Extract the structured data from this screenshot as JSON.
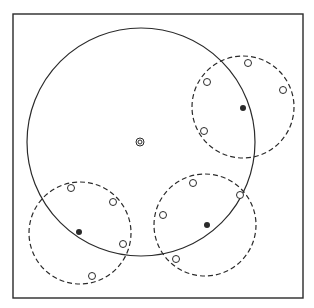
{
  "canvas": {
    "width": 314,
    "height": 308,
    "background": "#ffffff",
    "ink": "#2a2a2a"
  },
  "frame": {
    "x": 13,
    "y": 14,
    "width": 290,
    "height": 284
  },
  "main_circle": {
    "cx": 141,
    "cy": 142,
    "r": 114,
    "style": "solid"
  },
  "center_marker": {
    "cx": 140,
    "cy": 142,
    "outer_r": 4,
    "inner_r": 2
  },
  "clusters": [
    {
      "name": "upper-right",
      "circle": {
        "cx": 243,
        "cy": 107,
        "r": 51,
        "style": "dashed"
      },
      "center_point": {
        "cx": 243,
        "cy": 108,
        "filled": true
      },
      "points": [
        {
          "cx": 248,
          "cy": 63
        },
        {
          "cx": 207,
          "cy": 82
        },
        {
          "cx": 283,
          "cy": 90
        },
        {
          "cx": 204,
          "cy": 131
        }
      ]
    },
    {
      "name": "lower-left",
      "circle": {
        "cx": 80,
        "cy": 233,
        "r": 51,
        "style": "dashed"
      },
      "center_point": {
        "cx": 79,
        "cy": 232,
        "filled": true
      },
      "points": [
        {
          "cx": 71,
          "cy": 188
        },
        {
          "cx": 113,
          "cy": 202
        },
        {
          "cx": 123,
          "cy": 244
        },
        {
          "cx": 92,
          "cy": 276
        }
      ]
    },
    {
      "name": "lower-right",
      "circle": {
        "cx": 205,
        "cy": 225,
        "r": 51,
        "style": "dashed"
      },
      "center_point": {
        "cx": 207,
        "cy": 225,
        "filled": true
      },
      "points": [
        {
          "cx": 193,
          "cy": 183
        },
        {
          "cx": 240,
          "cy": 195
        },
        {
          "cx": 163,
          "cy": 215
        },
        {
          "cx": 176,
          "cy": 259
        }
      ]
    }
  ],
  "point_style": {
    "open_r": 3.5,
    "filled_r": 3
  }
}
